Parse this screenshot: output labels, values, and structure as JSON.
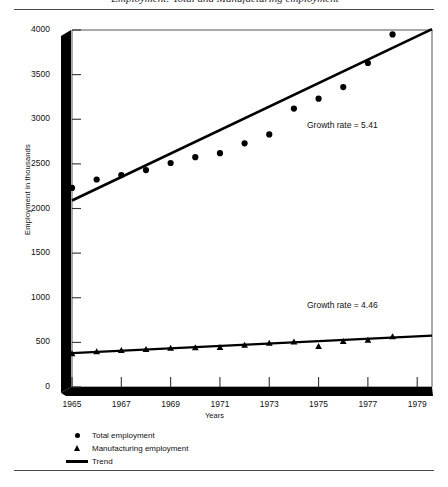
{
  "figure": {
    "title_partial": "Employment: Total and Manufacturing employment",
    "rule_color": "#4a4a4a"
  },
  "chart_data": {
    "type": "scatter",
    "title": "Employment: Total and Manufacturing employment",
    "xlabel": "Years",
    "ylabel": "Employment in thousands",
    "xlim": [
      1965,
      1979.6
    ],
    "ylim": [
      0,
      4000
    ],
    "ytick_labels": [
      "4000",
      "3500",
      "3000",
      "2500",
      "2000",
      "1500",
      "1000",
      "500",
      "0"
    ],
    "yticks": [
      4000,
      3500,
      3000,
      2500,
      2000,
      1500,
      1000,
      500,
      0
    ],
    "xtick_labels": [
      "1965",
      "1967",
      "1969",
      "1971",
      "1973",
      "1975",
      "1977",
      "1979"
    ],
    "xticks": [
      1965,
      1967,
      1969,
      1971,
      1973,
      1975,
      1977,
      1979
    ],
    "grid": false,
    "legend_position": "below-left",
    "series": [
      {
        "name": "Total employment",
        "marker": "circle",
        "x": [
          1965,
          1966,
          1967,
          1968,
          1969,
          1970,
          1971,
          1972,
          1973,
          1974,
          1975,
          1976,
          1977,
          1978
        ],
        "values": [
          2230,
          2325,
          2375,
          2430,
          2510,
          2575,
          2620,
          2730,
          2830,
          3120,
          3230,
          3360,
          3630,
          3950
        ]
      },
      {
        "name": "Manufacturing employment",
        "marker": "triangle",
        "x": [
          1965,
          1966,
          1967,
          1968,
          1969,
          1970,
          1971,
          1972,
          1973,
          1974,
          1975,
          1976,
          1977,
          1978
        ],
        "values": [
          375,
          395,
          410,
          420,
          435,
          440,
          445,
          470,
          490,
          505,
          455,
          510,
          525,
          565
        ]
      }
    ],
    "trend_lines": [
      {
        "name": "Trend (Total employment)",
        "x_start": 1965,
        "y_start": 2090,
        "x_end": 1979.6,
        "y_end": 4010,
        "growth_rate": "5.41",
        "annotation": "Growth rate  =  5.41"
      },
      {
        "name": "Trend (Manufacturing employment)",
        "x_start": 1965,
        "y_start": 380,
        "x_end": 1979.6,
        "y_end": 575,
        "growth_rate": "4.46",
        "annotation": "Growth rate  =  4.46"
      }
    ],
    "annotations": [
      {
        "text": "Growth rate  =  5.41",
        "x": 1975.0,
        "y": 2890
      },
      {
        "text": "Growth rate  =  4.46",
        "x": 1975.0,
        "y": 870
      }
    ],
    "legend": [
      {
        "marker": "circle",
        "label": "Total employment"
      },
      {
        "marker": "triangle",
        "label": "Manufacturing employment"
      },
      {
        "marker": "line",
        "label": "Trend"
      }
    ]
  }
}
